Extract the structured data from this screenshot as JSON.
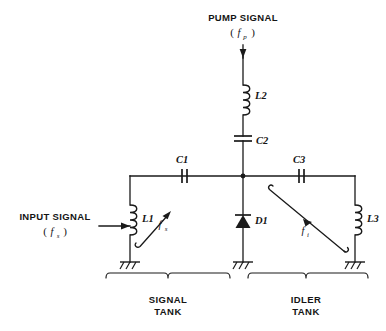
{
  "diagram": {
    "ink_color": "#1a1a1a",
    "background": "#ffffff"
  },
  "sources": {
    "pump": {
      "label": "PUMP SIGNAL",
      "freq_open": "(",
      "freq_symbol": "f",
      "freq_subscript": "p",
      "freq_close": ")",
      "arrow_direction": "down"
    },
    "input": {
      "label": "INPUT SIGNAL",
      "freq_open": "(",
      "freq_symbol": "f",
      "freq_subscript": "s",
      "freq_close": ")",
      "arrow_direction": "right"
    }
  },
  "components": [
    {
      "ref": "L2",
      "type": "inductor",
      "orientation": "vertical",
      "branch": "pump"
    },
    {
      "ref": "C2",
      "type": "capacitor",
      "orientation": "horizontal-plates",
      "branch": "pump"
    },
    {
      "ref": "C1",
      "type": "capacitor",
      "orientation": "vertical-plates",
      "branch": "signal-tank"
    },
    {
      "ref": "L1",
      "type": "inductor",
      "orientation": "vertical",
      "branch": "signal-tank"
    },
    {
      "ref": "D1",
      "type": "diode",
      "orientation": "vertical-up",
      "branch": "center"
    },
    {
      "ref": "C3",
      "type": "capacitor",
      "orientation": "vertical-plates",
      "branch": "idler-tank"
    },
    {
      "ref": "L3",
      "type": "inductor",
      "orientation": "vertical",
      "branch": "idler-tank"
    }
  ],
  "tuning": {
    "signal": {
      "symbol": "f",
      "subscript": "s"
    },
    "idler": {
      "symbol": "f",
      "subscript": "i"
    }
  },
  "tanks": [
    {
      "name": "signal",
      "line1": "SIGNAL",
      "line2": "TANK"
    },
    {
      "name": "idler",
      "line1": "IDLER",
      "line2": "TANK"
    }
  ],
  "grounds": [
    {
      "name": "signal-tank-ground"
    },
    {
      "name": "center-ground"
    },
    {
      "name": "idler-tank-ground"
    }
  ]
}
